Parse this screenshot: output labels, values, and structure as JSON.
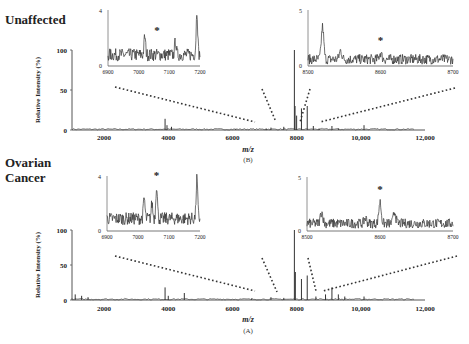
{
  "figure": {
    "panels": [
      {
        "id": "B",
        "label": "Unaffected",
        "caption": "(B)"
      },
      {
        "id": "A",
        "label_line1": "Ovarian",
        "label_line2": "Cancer",
        "caption": "(A)"
      }
    ],
    "xlabel": "m/z",
    "ylabel": "Relative Intensity (%)"
  },
  "chart_data": [
    {
      "type": "line",
      "title": "Unaffected",
      "panel_caption": "(B)",
      "xlabel": "m/z",
      "ylabel": "Relative Intensity (%)",
      "xlim": [
        1000,
        12000
      ],
      "ylim": [
        0,
        100
      ],
      "xticks": [
        2000,
        4000,
        6000,
        8000,
        10000,
        12000
      ],
      "xtick_labels": [
        "2000",
        "4000",
        "6000",
        "8000",
        "10,000",
        "12,000"
      ],
      "yticks": [
        0,
        50,
        100
      ],
      "peaks": [
        {
          "x": 3900,
          "y": 14
        },
        {
          "x": 3960,
          "y": 6
        },
        {
          "x": 4100,
          "y": 4
        },
        {
          "x": 6100,
          "y": 1
        },
        {
          "x": 7050,
          "y": 2
        },
        {
          "x": 7200,
          "y": 3
        },
        {
          "x": 7600,
          "y": 4
        },
        {
          "x": 7930,
          "y": 100
        },
        {
          "x": 7950,
          "y": 30
        },
        {
          "x": 8000,
          "y": 18
        },
        {
          "x": 8150,
          "y": 27
        },
        {
          "x": 8330,
          "y": 30
        },
        {
          "x": 8520,
          "y": 5
        },
        {
          "x": 8700,
          "y": 2
        },
        {
          "x": 9100,
          "y": 5
        },
        {
          "x": 9300,
          "y": 2
        },
        {
          "x": 10100,
          "y": 6
        }
      ],
      "insets": [
        {
          "xlim": [
            6900,
            7200
          ],
          "ylim": [
            0,
            4
          ],
          "xtick_labels": [
            "6900",
            "7000",
            "7100",
            "7200"
          ],
          "ytick_labels": [
            "0",
            "4"
          ],
          "annotation": {
            "text": "*",
            "x": 7060,
            "y": 2.3
          },
          "peaks": [
            {
              "x": 7020,
              "y": 2.1
            },
            {
              "x": 7120,
              "y": 1.8
            },
            {
              "x": 7190,
              "y": 4.0
            }
          ],
          "baseline": 0.8
        },
        {
          "xlim": [
            8500,
            8700
          ],
          "ylim": [
            0,
            5
          ],
          "xtick_labels": [
            "8500",
            "8600",
            "8700"
          ],
          "ytick_labels": [
            "0",
            "5"
          ],
          "annotation": {
            "text": "*",
            "x": 8600,
            "y": 2.0
          },
          "peaks": [
            {
              "x": 8520,
              "y": 3.5
            },
            {
              "x": 8545,
              "y": 1.4
            },
            {
              "x": 8600,
              "y": 1.2
            }
          ],
          "baseline": 0.6
        }
      ]
    },
    {
      "type": "line",
      "title": "Ovarian Cancer",
      "panel_caption": "(A)",
      "xlabel": "m/z",
      "ylabel": "Relative Intensity (%)",
      "xlim": [
        1000,
        12000
      ],
      "ylim": [
        0,
        100
      ],
      "xticks": [
        2000,
        4000,
        6000,
        8000,
        10000,
        12000
      ],
      "xtick_labels": [
        "2000",
        "4000",
        "6000",
        "8000",
        "10,000",
        "12,000"
      ],
      "yticks": [
        0,
        50,
        100
      ],
      "peaks": [
        {
          "x": 1100,
          "y": 8
        },
        {
          "x": 1300,
          "y": 6
        },
        {
          "x": 1500,
          "y": 4
        },
        {
          "x": 3900,
          "y": 18
        },
        {
          "x": 4000,
          "y": 6
        },
        {
          "x": 4500,
          "y": 10
        },
        {
          "x": 6600,
          "y": 2
        },
        {
          "x": 7200,
          "y": 4
        },
        {
          "x": 7600,
          "y": 3
        },
        {
          "x": 7930,
          "y": 100
        },
        {
          "x": 7960,
          "y": 40
        },
        {
          "x": 8150,
          "y": 30
        },
        {
          "x": 8330,
          "y": 35
        },
        {
          "x": 8600,
          "y": 5
        },
        {
          "x": 8900,
          "y": 8
        },
        {
          "x": 9100,
          "y": 18
        },
        {
          "x": 9300,
          "y": 8
        },
        {
          "x": 9500,
          "y": 5
        },
        {
          "x": 10100,
          "y": 5
        }
      ],
      "insets": [
        {
          "xlim": [
            6900,
            7200
          ],
          "ylim": [
            0,
            4
          ],
          "xtick_labels": [
            "6900",
            "7000",
            "7100",
            "7200"
          ],
          "ytick_labels": [
            "0",
            "4"
          ],
          "annotation": {
            "text": "*",
            "x": 7060,
            "y": 3.8
          },
          "peaks": [
            {
              "x": 7020,
              "y": 2.4
            },
            {
              "x": 7060,
              "y": 3.4
            },
            {
              "x": 7045,
              "y": 2.0
            },
            {
              "x": 7190,
              "y": 3.8
            }
          ],
          "baseline": 0.9
        },
        {
          "xlim": [
            8500,
            8700
          ],
          "ylim": [
            0,
            5
          ],
          "xtick_labels": [
            "8500",
            "8600",
            "8700"
          ],
          "ytick_labels": [
            "0",
            "5"
          ],
          "annotation": {
            "text": "*",
            "x": 8600,
            "y": 3.5
          },
          "peaks": [
            {
              "x": 8520,
              "y": 1.8
            },
            {
              "x": 8600,
              "y": 2.7
            },
            {
              "x": 8620,
              "y": 1.8
            },
            {
              "x": 8580,
              "y": 1.2
            }
          ],
          "baseline": 0.7
        }
      ]
    }
  ]
}
